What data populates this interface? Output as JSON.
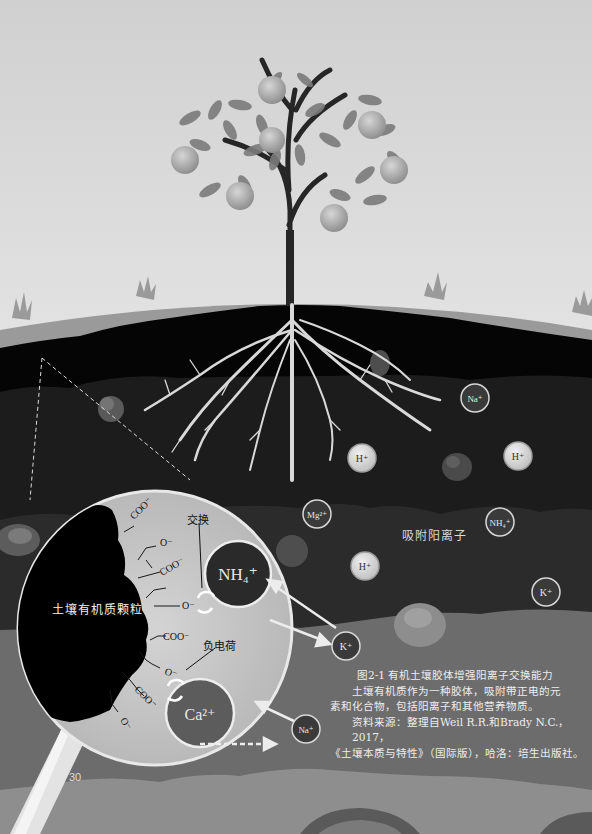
{
  "figure": {
    "title": "图2-1 有机土壤胶体增强阳离子交换能力",
    "description_line1": "土壤有机质作为一种胶体，吸附带正电的元",
    "description_line2": "素和化合物，包括阳离子和其他营养物质。",
    "source_line1": "资料来源：整理自Weil  R.R.和Brady  N.C.，2017，",
    "source_line2": "《土壤本质与特性》（国际版），哈洛：培生出版社。"
  },
  "page_number": "30",
  "labels": {
    "adsorbed_cations": "吸附阳离子",
    "organic_particle": "土壤有机质颗粒",
    "exchange": "交换",
    "negative_charge": "负电荷"
  },
  "functional_groups": [
    "COO⁻",
    "O⁻",
    "COO⁻",
    "O⁻",
    "COO⁻",
    "O⁻",
    "COO⁻",
    "O⁻"
  ],
  "soil_ions": [
    {
      "label": "Na⁺",
      "x": 475,
      "y": 398,
      "style": "dark"
    },
    {
      "label": "H⁺",
      "x": 362,
      "y": 458,
      "style": "light"
    },
    {
      "label": "H⁺",
      "x": 518,
      "y": 456,
      "style": "light"
    },
    {
      "label": "Mg²⁺",
      "x": 317,
      "y": 514,
      "style": "dark"
    },
    {
      "label": "NH₄⁺",
      "x": 500,
      "y": 522,
      "style": "dark"
    },
    {
      "label": "H⁺",
      "x": 365,
      "y": 566,
      "style": "light"
    },
    {
      "label": "K⁺",
      "x": 546,
      "y": 592,
      "style": "dark"
    },
    {
      "label": "K⁺",
      "x": 346,
      "y": 646,
      "style": "dark"
    },
    {
      "label": "Na⁺",
      "x": 306,
      "y": 729,
      "style": "dark"
    }
  ],
  "magnified_ions": [
    {
      "label": "NH₄⁺",
      "x": 238,
      "y": 574
    },
    {
      "label": "Ca²⁺",
      "x": 200,
      "y": 713
    }
  ],
  "colors": {
    "sky_top": "#d2d2d2",
    "sky_bottom": "#f8f8f8",
    "ground_surface": "#9a9a9a",
    "topsoil": "#050505",
    "subsoil": "#1f1f1f",
    "lower_soil": "#6a6a6a",
    "bottom_soil": "#8c8c8c",
    "lens_fill": "#c8c8c8",
    "roots": "#d9d9d9"
  }
}
